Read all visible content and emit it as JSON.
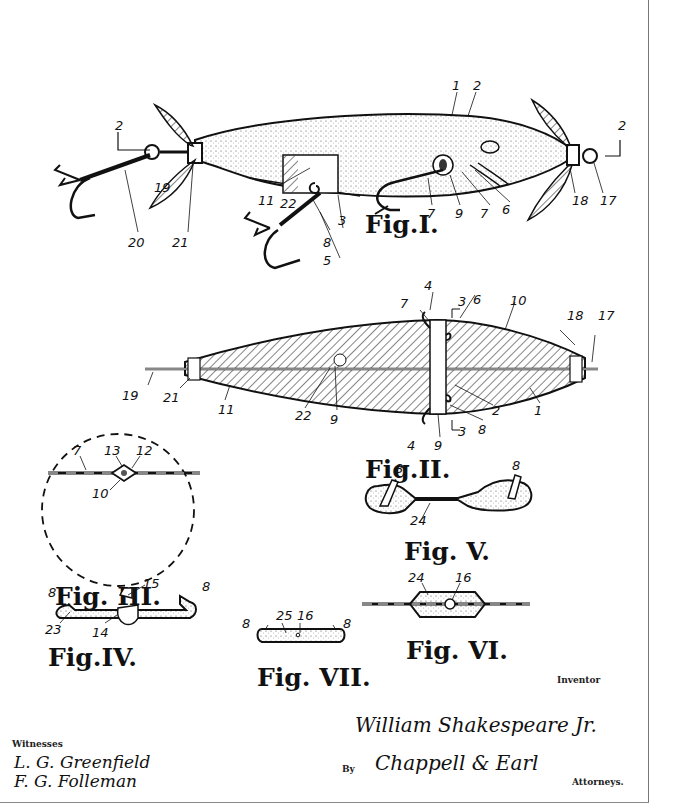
{
  "document": {
    "type": "patent drawing",
    "subject": "fishing lure"
  },
  "figures": [
    {
      "id": "fig1",
      "caption": "Fig.I.",
      "labels": [
        "1",
        "2",
        "2",
        "2",
        "3",
        "5",
        "6",
        "7",
        "7",
        "8",
        "9",
        "11",
        "17",
        "18",
        "19",
        "20",
        "21",
        "22"
      ]
    },
    {
      "id": "fig2",
      "caption": "Fig.II.",
      "labels": [
        "1",
        "2",
        "3",
        "3",
        "4",
        "4",
        "6",
        "7",
        "8",
        "9",
        "9",
        "10",
        "11",
        "17",
        "18",
        "19",
        "21",
        "22"
      ]
    },
    {
      "id": "fig3",
      "caption": "Fig. III.",
      "labels": [
        "7",
        "13",
        "12",
        "10"
      ]
    },
    {
      "id": "fig4",
      "caption": "Fig.IV.",
      "labels": [
        "8",
        "15",
        "8",
        "23",
        "14"
      ]
    },
    {
      "id": "fig5",
      "caption": "Fig. V.",
      "labels": [
        "8",
        "8",
        "24"
      ]
    },
    {
      "id": "fig6",
      "caption": "Fig. VI.",
      "labels": [
        "24",
        "16"
      ]
    },
    {
      "id": "fig7",
      "caption": "Fig. VII.",
      "labels": [
        "8",
        "25",
        "16",
        "8"
      ]
    }
  ],
  "fig1": {
    "caption": "Fig.I.",
    "l1": "1",
    "l2": "2",
    "sec_left": "2",
    "sec_right": "2",
    "l3": "3",
    "l5": "5",
    "l6": "6",
    "l7a": "7",
    "l7b": "7",
    "l8": "8",
    "l9": "9",
    "l11": "11",
    "l17": "17",
    "l18": "18",
    "l19": "19",
    "l20": "20",
    "l21": "21",
    "l22": "22"
  },
  "fig2": {
    "caption": "Fig.II.",
    "l1": "1",
    "l2": "2",
    "l3top": "3",
    "l3bot": "3",
    "l4top": "4",
    "l4bot": "4",
    "l6": "6",
    "l7": "7",
    "l8": "8",
    "l9a": "9",
    "l9b": "9",
    "l10": "10",
    "l11": "11",
    "l17": "17",
    "l18": "18",
    "l19": "19",
    "l21": "21",
    "l22": "22"
  },
  "fig3": {
    "caption": "Fig. III.",
    "l7": "7",
    "l13": "13",
    "l12": "12",
    "l10": "10"
  },
  "fig4": {
    "caption": "Fig.IV.",
    "l8a": "8",
    "l15": "15",
    "l8b": "8",
    "l23": "23",
    "l14": "14"
  },
  "fig5": {
    "caption": "Fig. V.",
    "l8a": "8",
    "l8b": "8",
    "l24": "24"
  },
  "fig6": {
    "caption": "Fig. VI.",
    "l24": "24",
    "l16": "16"
  },
  "fig7": {
    "caption": "Fig. VII.",
    "l8a": "8",
    "l25": "25",
    "l16": "16",
    "l8b": "8"
  },
  "signatures": {
    "inventor_label": "Inventor",
    "inventor_name": "William Shakespeare Jr.",
    "by_label": "By",
    "attorney_name": "Chappell & Earl",
    "attorneys_label": "Attorneys.",
    "witnesses_label": "Witnesses",
    "witness_1": "L. G. Greenfield",
    "witness_2": "F. G. Folleman"
  },
  "colors": {
    "ink": "#111111",
    "paper": "#ffffff",
    "frame": "#777777"
  }
}
